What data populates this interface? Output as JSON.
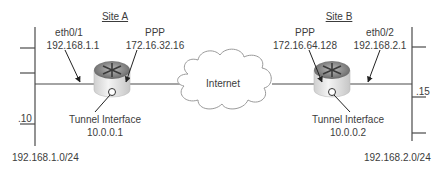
{
  "diagram": {
    "type": "network-topology",
    "cloud": {
      "label": "Internet"
    },
    "site_a": {
      "title": "Site A",
      "lan_interface": {
        "name": "eth0/1",
        "ip": "192.168.1.1"
      },
      "wan_interface": {
        "name": "PPP",
        "ip": "172.16.32.16"
      },
      "tunnel": {
        "label": "Tunnel Interface",
        "ip": "10.0.0.1"
      },
      "host_suffix": ".10",
      "subnet": "192.168.1.0/24"
    },
    "site_b": {
      "title": "Site B",
      "lan_interface": {
        "name": "eth0/2",
        "ip": "192.168.2.1"
      },
      "wan_interface": {
        "name": "PPP",
        "ip": "172.16.64.128"
      },
      "tunnel": {
        "label": "Tunnel Interface",
        "ip": "10.0.0.2"
      },
      "host_suffix": ".15",
      "subnet": "192.168.2.0/24"
    },
    "colors": {
      "line": "#4a4a4a",
      "cloud_stroke": "#9a9a9a",
      "router_body": "#e6e6e6",
      "router_top": "#8a8a8a"
    }
  }
}
